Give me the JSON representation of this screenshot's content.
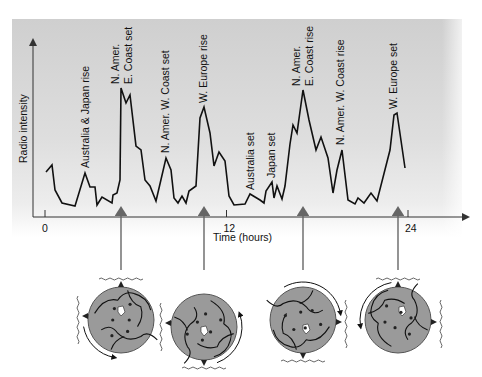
{
  "chart_data": {
    "type": "line",
    "title": "",
    "xlabel": "Time (hours)",
    "ylabel": "Radio intensity",
    "x_ticks": [
      {
        "label": "0",
        "value": 0
      },
      {
        "label": "12",
        "value": 12
      },
      {
        "label": "24",
        "value": 24
      }
    ],
    "xlim": [
      -0.8,
      28
    ],
    "ylim_note": "relative intensity, no numeric y ticks",
    "series": [
      {
        "name": "Radio intensity",
        "points_px": [
          [
            46,
            172
          ],
          [
            52,
            165
          ],
          [
            55,
            190
          ],
          [
            62,
            203
          ],
          [
            75,
            206
          ],
          [
            85,
            173
          ],
          [
            90,
            187
          ],
          [
            95,
            187
          ],
          [
            97,
            205
          ],
          [
            102,
            197
          ],
          [
            112,
            203
          ],
          [
            113,
            195
          ],
          [
            117,
            193
          ],
          [
            120,
            180
          ],
          [
            121,
            88
          ],
          [
            126,
            103
          ],
          [
            130,
            95
          ],
          [
            136,
            146
          ],
          [
            141,
            150
          ],
          [
            145,
            180
          ],
          [
            150,
            186
          ],
          [
            156,
            201
          ],
          [
            166,
            158
          ],
          [
            171,
            170
          ],
          [
            174,
            198
          ],
          [
            178,
            203
          ],
          [
            182,
            196
          ],
          [
            186,
            203
          ],
          [
            189,
            191
          ],
          [
            196,
            186
          ],
          [
            200,
            118
          ],
          [
            204,
            107
          ],
          [
            210,
            133
          ],
          [
            214,
            166
          ],
          [
            219,
            152
          ],
          [
            225,
            161
          ],
          [
            229,
            196
          ],
          [
            234,
            205
          ],
          [
            245,
            204
          ],
          [
            250,
            194
          ],
          [
            260,
            200
          ],
          [
            264,
            203
          ],
          [
            266,
            191
          ],
          [
            272,
            182
          ],
          [
            274,
            198
          ],
          [
            277,
            186
          ],
          [
            282,
            199
          ],
          [
            285,
            186
          ],
          [
            290,
            144
          ],
          [
            293,
            125
          ],
          [
            297,
            133
          ],
          [
            303,
            90
          ],
          [
            309,
            120
          ],
          [
            316,
            150
          ],
          [
            321,
            137
          ],
          [
            328,
            158
          ],
          [
            333,
            193
          ],
          [
            337,
            170
          ],
          [
            342,
            150
          ],
          [
            348,
            200
          ],
          [
            355,
            204
          ],
          [
            358,
            198
          ],
          [
            364,
            203
          ],
          [
            371,
            193
          ],
          [
            377,
            201
          ],
          [
            390,
            150
          ],
          [
            394,
            115
          ],
          [
            397,
            113
          ],
          [
            405,
            168
          ]
        ]
      }
    ],
    "annotations": [
      {
        "text": "Australia & Japan rise",
        "x": 89,
        "y": 168,
        "rotate": -90
      },
      {
        "text": "N. Amer.",
        "x": 119,
        "y": 84,
        "rotate": -90
      },
      {
        "text": "E. Coast set",
        "x": 132,
        "y": 84,
        "rotate": -90
      },
      {
        "text": "N. Amer. W. Coast set",
        "x": 169,
        "y": 153,
        "rotate": -90
      },
      {
        "text": "W. Europe rise",
        "x": 207,
        "y": 103,
        "rotate": -90
      },
      {
        "text": "Australia set",
        "x": 254,
        "y": 190,
        "rotate": -90
      },
      {
        "text": "Japan set",
        "x": 275,
        "y": 178,
        "rotate": -90
      },
      {
        "text": "N. Amer.",
        "x": 300,
        "y": 86,
        "rotate": -90
      },
      {
        "text": "E. Coast rise",
        "x": 313,
        "y": 86,
        "rotate": -90
      },
      {
        "text": "N. Amer. W. Coast rise",
        "x": 344,
        "y": 145,
        "rotate": -90
      },
      {
        "text": "W. Europe set",
        "x": 397,
        "y": 109,
        "rotate": -90
      }
    ],
    "grid": false,
    "legend": "none"
  },
  "arrows": [
    {
      "x": 121,
      "y_top": 207,
      "y_bottom": 270
    },
    {
      "x": 204,
      "y_top": 207,
      "y_bottom": 270
    },
    {
      "x": 303,
      "y_top": 207,
      "y_bottom": 270
    },
    {
      "x": 398,
      "y_top": 207,
      "y_bottom": 270
    }
  ],
  "globes": [
    {
      "cx": 121,
      "cy": 320,
      "r": 33,
      "rotation_arrow": "left-bottom",
      "antenna": "top,left"
    },
    {
      "cx": 204,
      "cy": 327,
      "r": 33,
      "rotation_arrow": "right",
      "antenna": "bottom,left"
    },
    {
      "cx": 303,
      "cy": 320,
      "r": 33,
      "rotation_arrow": "top-right",
      "antenna": "bottom,right"
    },
    {
      "cx": 398,
      "cy": 320,
      "r": 33,
      "rotation_arrow": "left",
      "antenna": "top,right"
    }
  ],
  "colors": {
    "line": "#111111",
    "axis": "#333333",
    "arrow": "#666666",
    "globe_fill": "#9a9a9a",
    "globe_stroke": "#555555",
    "panel_top": "#cfcfcf",
    "panel_bottom": "#f0f0f0"
  }
}
